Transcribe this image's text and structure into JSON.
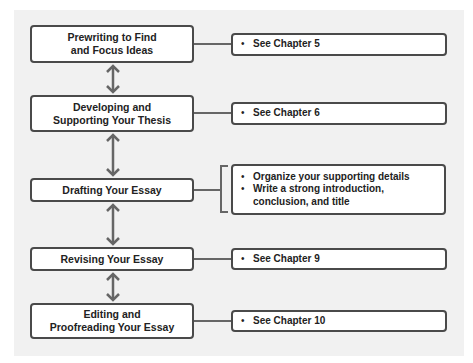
{
  "diagram": {
    "type": "flowchart",
    "steps": [
      {
        "label_line1": "Prewriting to Find",
        "label_line2": "and Focus Ideas",
        "details": [
          "See Chapter 5"
        ]
      },
      {
        "label_line1": "Developing and",
        "label_line2": "Supporting Your Thesis",
        "details": [
          "See Chapter 6"
        ]
      },
      {
        "label_line1": "Drafting Your Essay",
        "label_line2": "",
        "details": [
          "Organize your supporting details",
          "Write a strong introduction, conclusion, and title"
        ]
      },
      {
        "label_line1": "Revising Your Essay",
        "label_line2": "",
        "details": [
          "See Chapter 9"
        ]
      },
      {
        "label_line1": "Editing and",
        "label_line2": "Proofreading Your Essay",
        "details": [
          "See Chapter 10"
        ]
      }
    ],
    "arrows": [
      "bidirectional",
      "bidirectional",
      "bidirectional",
      "bidirectional"
    ],
    "colors": {
      "border": "#4a4a4a",
      "connector": "#666666",
      "panel": "#f1f1f1",
      "box": "#ffffff"
    }
  }
}
